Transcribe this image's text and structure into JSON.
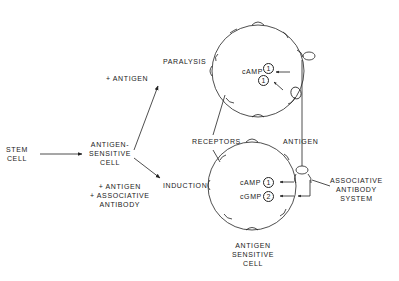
{
  "diagram": {
    "stem_cell": [
      "STEM",
      "CELL"
    ],
    "antigen_sensitive_cell": [
      "ANTIGEN-",
      "SENSITIVE",
      "CELL"
    ],
    "upper_path_label": "+ ANTIGEN",
    "lower_path_label": [
      "+ ANTIGEN",
      "+ ASSOCIATIVE",
      "ANTIBODY"
    ],
    "outcome_top": "PARALYSIS",
    "outcome_bottom": "INDUCTION",
    "receptors_label": "RECEPTORS",
    "antigen_label": "ANTIGEN",
    "associative_system": [
      "ASSOCIATIVE",
      "ANTIBODY",
      "SYSTEM"
    ],
    "bottom_cell_label": [
      "ANTIGEN",
      "SENSITIVE",
      "CELL"
    ],
    "top_cell": {
      "messenger": "cAMP",
      "signals": [
        "1",
        "1"
      ]
    },
    "bottom_cell": {
      "messengers": [
        {
          "name": "cAMP",
          "signal": "1"
        },
        {
          "name": "cGMP",
          "signal": "2"
        }
      ]
    },
    "colors": {
      "line": "#222222",
      "background": "#ffffff"
    }
  }
}
